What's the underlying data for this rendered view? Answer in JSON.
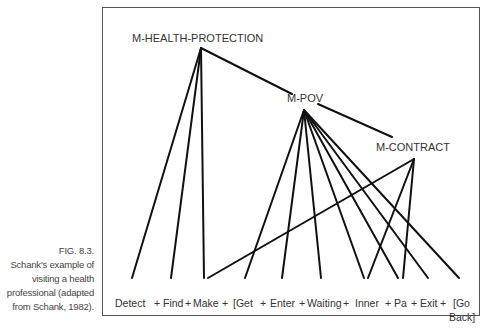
{
  "figure": {
    "caption_lines": [
      "FIG. 8.3.",
      "Schank's example of",
      "visiting a health",
      "professional (adapted",
      "from Schank, 1982)."
    ]
  },
  "nodes": {
    "root": "M-HEALTH-PROTECTION",
    "pov": "M-POV",
    "contract": "M-CONTRACT"
  },
  "leaves": [
    "Detect",
    "+",
    "Find",
    "+",
    "Make",
    "+",
    "[Get",
    "+",
    "Enter",
    "+",
    "Waiting",
    "+",
    "Inner",
    "+",
    "Pa",
    "+",
    "Exit",
    "+",
    "[Go",
    "Back]"
  ],
  "edges": {
    "root_children": [
      "Detect",
      "Find",
      "Make",
      "M-POV"
    ],
    "pov_children": [
      "[Get",
      "Enter",
      "Waiting",
      "Inner",
      "Pa",
      "Exit",
      "[Go Back]",
      "M-CONTRACT"
    ],
    "contract_children": [
      "Make",
      "Inner",
      "Pa"
    ]
  }
}
